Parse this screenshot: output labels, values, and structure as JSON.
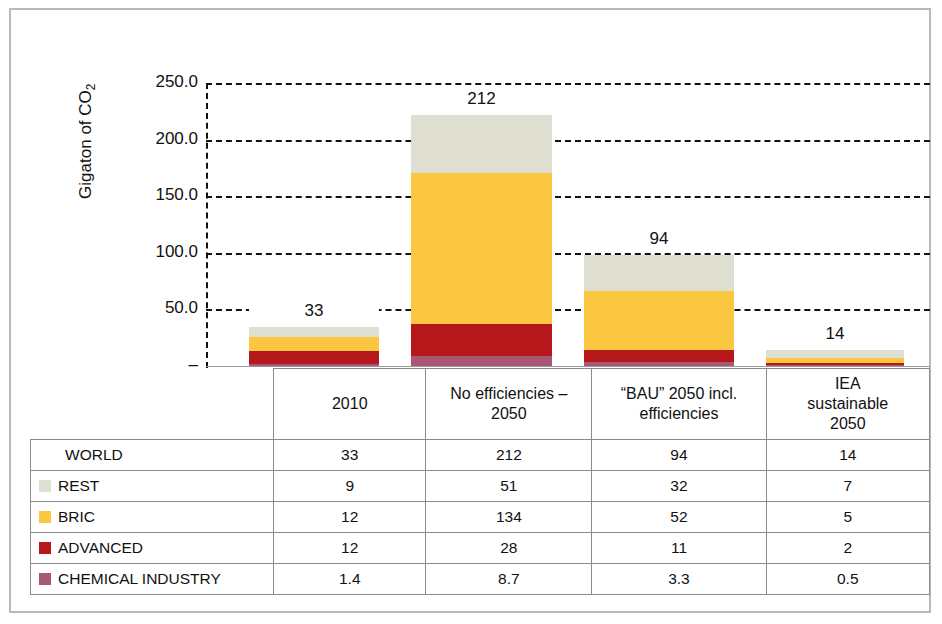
{
  "chart_data": {
    "type": "bar",
    "subtype": "stacked-bar",
    "title": "",
    "xlabel": "",
    "ylabel": "Gigaton of CO2",
    "ylabel_html": "Gigaton of CO<sub>2</sub>",
    "ylim": [
      0,
      250
    ],
    "ytick_values": [
      250,
      200,
      150,
      100,
      50,
      0
    ],
    "ytick_labels": [
      "250.0",
      "200.0",
      "150.0",
      "100.0",
      "50.0",
      "–"
    ],
    "grid": true,
    "grid_style": "dashed",
    "legend_position": "table-row-labels",
    "categories": [
      "2010",
      "No efficiencies – 2050",
      "“BAU” 2050 incl. efficiencies",
      "IEA sustainable 2050"
    ],
    "series": [
      {
        "name": "CHEMICAL INDUSTRY",
        "color": "#a85874",
        "values": [
          1.4,
          8.7,
          3.3,
          0.5
        ]
      },
      {
        "name": "ADVANCED",
        "color": "#b5171b",
        "values": [
          12,
          28,
          11,
          2
        ]
      },
      {
        "name": "BRIC",
        "color": "#fbc740",
        "values": [
          12,
          134,
          52,
          5
        ]
      },
      {
        "name": "REST",
        "color": "#dedfd0",
        "values": [
          9,
          51,
          32,
          7
        ]
      }
    ],
    "totals_label": "WORLD",
    "totals": [
      33,
      212,
      94,
      14
    ],
    "bar_value_labels": [
      "33",
      "212",
      "94",
      "14"
    ]
  },
  "axis": {
    "y_label_html": "Gigaton of CO<sub>2</sub>",
    "ticks": [
      {
        "label": "250.0",
        "value": 250
      },
      {
        "label": "200.0",
        "value": 200
      },
      {
        "label": "150.0",
        "value": 150
      },
      {
        "label": "100.0",
        "value": 100
      },
      {
        "label": "50.0",
        "value": 50
      },
      {
        "label": "–",
        "value": 0
      }
    ]
  },
  "table": {
    "column_headers": [
      "",
      "2010",
      "No efficiencies – 2050",
      "“BAU” 2050 incl. efficiencies",
      "IEA sustainable 2050"
    ],
    "column_headers_lines": [
      [
        ""
      ],
      [
        "2010"
      ],
      [
        "No efficiencies –",
        "2050"
      ],
      [
        "“BAU” 2050 incl.",
        "efficiencies"
      ],
      [
        "IEA",
        "sustainable",
        "2050"
      ]
    ],
    "rows": [
      {
        "label": "WORLD",
        "swatch": null,
        "values": [
          "33",
          "212",
          "94",
          "14"
        ]
      },
      {
        "label": "REST",
        "swatch": "#dedfd0",
        "values": [
          "9",
          "51",
          "32",
          "7"
        ]
      },
      {
        "label": "BRIC",
        "swatch": "#fbc740",
        "values": [
          "12",
          "134",
          "52",
          "5"
        ]
      },
      {
        "label": "ADVANCED",
        "swatch": "#b5171b",
        "values": [
          "12",
          "28",
          "11",
          "2"
        ]
      },
      {
        "label": "CHEMICAL INDUSTRY",
        "swatch": "#a85874",
        "values": [
          "1.4",
          "8.7",
          "3.3",
          "0.5"
        ]
      }
    ]
  },
  "colors": {
    "rest": "#dedfd0",
    "bric": "#fbc740",
    "advanced": "#b5171b",
    "chemical_industry": "#a85874",
    "gridline": "#111111",
    "frame": "#b9b9b9",
    "table_border": "#8a8a8a",
    "background": "#ffffff"
  }
}
